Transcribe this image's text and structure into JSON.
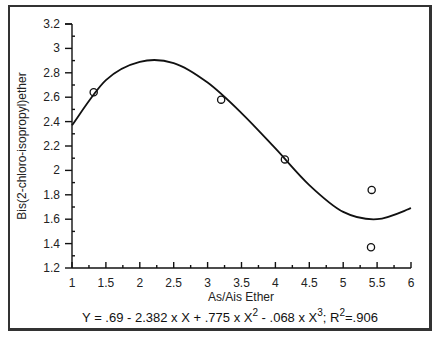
{
  "chart_data": {
    "type": "scatter",
    "title": "",
    "xlabel": "As/Ais Ether",
    "ylabel": "Bis(2-chloro-isopropyl)ether",
    "xlim": [
      1,
      6
    ],
    "ylim": [
      1.2,
      3.2
    ],
    "x_ticks": [
      "1",
      "1.5",
      "2",
      "2.5",
      "3",
      "3.5",
      "4",
      "4.5",
      "5",
      "5.5",
      "6"
    ],
    "y_ticks": [
      "1.2",
      "1.4",
      "1.6",
      "1.8",
      "2",
      "2.2",
      "2.4",
      "2.6",
      "2.8",
      "3",
      "3.2"
    ],
    "grid": false,
    "legend": null,
    "series": [
      {
        "name": "observed",
        "marker": "open-circle",
        "points": [
          {
            "x": 1.32,
            "y": 2.64
          },
          {
            "x": 3.2,
            "y": 2.58
          },
          {
            "x": 4.14,
            "y": 2.09
          },
          {
            "x": 5.42,
            "y": 1.84
          },
          {
            "x": 5.41,
            "y": 1.37
          }
        ]
      },
      {
        "name": "cubic fit",
        "type": "line",
        "points": [
          {
            "x": 1.0,
            "y": 2.37
          },
          {
            "x": 1.5,
            "y": 2.74
          },
          {
            "x": 2.0,
            "y": 2.89
          },
          {
            "x": 2.5,
            "y": 2.88
          },
          {
            "x": 3.0,
            "y": 2.72
          },
          {
            "x": 3.5,
            "y": 2.47
          },
          {
            "x": 4.0,
            "y": 2.18
          },
          {
            "x": 4.5,
            "y": 1.88
          },
          {
            "x": 5.0,
            "y": 1.66
          },
          {
            "x": 5.5,
            "y": 1.6
          },
          {
            "x": 6.0,
            "y": 1.69
          }
        ]
      }
    ],
    "annotation": {
      "equation_parts": [
        "Y = .69 - 2.382 x X + .775 x X",
        "2",
        " - .068 x X",
        "3",
        "; R",
        "2",
        "=.906"
      ]
    }
  }
}
